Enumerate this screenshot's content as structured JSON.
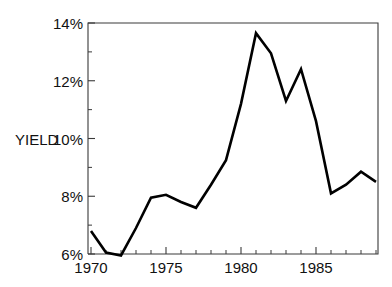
{
  "chart_data": {
    "type": "line",
    "title": "",
    "subtitle": "",
    "xlabel": "",
    "ylabel": "YIELD",
    "x": [
      1970,
      1971,
      1972,
      1973,
      1974,
      1975,
      1976,
      1977,
      1978,
      1979,
      1980,
      1981,
      1982,
      1983,
      1984,
      1985,
      1986,
      1987,
      1988,
      1989
    ],
    "values": [
      6.8,
      6.05,
      5.95,
      6.9,
      7.95,
      8.05,
      7.8,
      7.6,
      8.4,
      9.25,
      11.2,
      13.65,
      12.95,
      11.3,
      12.4,
      10.6,
      8.1,
      8.4,
      8.85,
      8.5
    ],
    "series": [
      {
        "name": "YIELD",
        "values": [
          6.8,
          6.05,
          5.95,
          6.9,
          7.95,
          8.05,
          7.8,
          7.6,
          8.4,
          9.25,
          11.2,
          13.65,
          12.95,
          11.3,
          12.4,
          10.6,
          8.1,
          8.4,
          8.85,
          8.5
        ]
      }
    ],
    "xlim": [
      1970,
      1989
    ],
    "ylim": [
      6,
      14
    ],
    "xticks": [
      1970,
      1975,
      1980,
      1985
    ],
    "xticklabels": [
      "1970",
      "1975",
      "1980",
      "1985"
    ],
    "xminorticks": [
      1971,
      1972,
      1973,
      1974,
      1976,
      1977,
      1978,
      1979,
      1981,
      1982,
      1983,
      1984,
      1986,
      1987,
      1988,
      1989
    ],
    "yticks": [
      6,
      8,
      10,
      12,
      14
    ],
    "yticklabels": [
      "6%",
      "8%",
      "10%",
      "12%",
      "14%"
    ],
    "yminorticks": [
      7,
      9,
      11,
      13
    ],
    "grid": false,
    "legend": null,
    "legend_position": "none",
    "line_color": "#000000",
    "axis_color": "#3a3a3a",
    "background_color": "#ffffff"
  },
  "axis": {
    "y_label": "YIELD",
    "y_tick_labels": [
      "14%",
      "12%",
      "10%",
      "8%",
      "6%"
    ],
    "x_tick_labels": [
      "1970",
      "1975",
      "1980",
      "1985"
    ]
  }
}
